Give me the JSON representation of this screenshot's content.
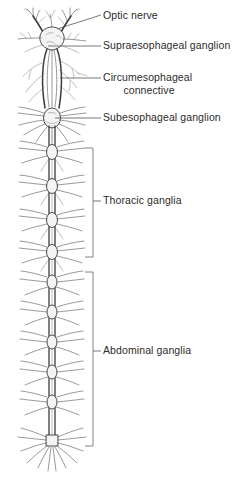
{
  "figure": {
    "background_color": "#ffffff",
    "ink_color": "#3a3a3a",
    "text_color": "#2b2b2b"
  },
  "labels": {
    "optic_nerve": "Optic nerve",
    "supraesophageal_ganglion": "Supraesophageal ganglion",
    "circumesophageal_connective_line1": "Circumesophageal",
    "circumesophageal_connective_line2": "connective",
    "subesophageal_ganglion": "Subesophageal ganglion",
    "thoracic_ganglia": "Thoracic ganglia",
    "abdominal_ganglia": "Abdominal ganglia"
  },
  "leaders": [
    {
      "name": "optic-nerve-leader",
      "type": "diagonal",
      "x1": 57,
      "y1": 29,
      "x2": 101,
      "y2": 15
    },
    {
      "name": "supraesophageal-leader",
      "type": "horizontal",
      "x1": 48,
      "y1": 46,
      "x2": 101,
      "y2": 46
    },
    {
      "name": "circumesophageal-leader",
      "type": "horizontal",
      "x1": 60,
      "y1": 78,
      "x2": 101,
      "y2": 78
    },
    {
      "name": "subesophageal-leader",
      "type": "horizontal",
      "x1": 55,
      "y1": 118,
      "x2": 101,
      "y2": 118
    },
    {
      "name": "thoracic-bracket-tick",
      "type": "horizontal",
      "x1": 93,
      "y1": 201,
      "x2": 101,
      "y2": 201
    },
    {
      "name": "abdominal-bracket-tick",
      "type": "horizontal",
      "x1": 93,
      "y1": 351,
      "x2": 101,
      "y2": 351
    }
  ],
  "brackets": [
    {
      "name": "thoracic-bracket",
      "x": 93,
      "y_top": 148,
      "y_bottom": 257,
      "arm": 8
    },
    {
      "name": "abdominal-bracket",
      "x": 93,
      "y_top": 272,
      "y_bottom": 446,
      "arm": 8
    }
  ],
  "anatomy": {
    "nerve_cord": {
      "x_center": 52,
      "y_top": 118,
      "y_bottom": 446
    },
    "brain": {
      "x_center": 52,
      "y": 30,
      "label": "supraesophageal ganglion"
    },
    "subesophageal_ganglion": {
      "x_center": 52,
      "y": 118
    },
    "thoracic_ganglia_positions": [
      152,
      186,
      220,
      252
    ],
    "abdominal_ganglia_positions": [
      282,
      312,
      342,
      372,
      402,
      440
    ],
    "terminal_ganglion": {
      "x_center": 52,
      "y": 440
    }
  }
}
